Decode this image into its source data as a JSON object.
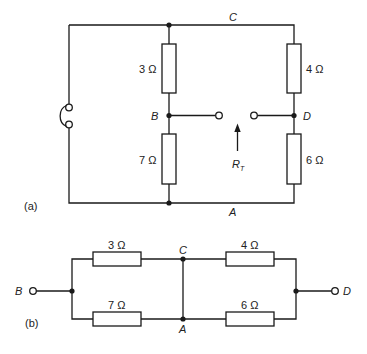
{
  "diagram_a": {
    "caption": "(a)",
    "nodes": {
      "C": "C",
      "B": "B",
      "D": "D",
      "A": "A"
    },
    "resistors": {
      "top_left": "3 Ω",
      "bottom_left": "7 Ω",
      "top_right": "4 Ω",
      "bottom_right": "6 Ω"
    },
    "rt_label": {
      "main": "R",
      "subscript": "T"
    }
  },
  "diagram_b": {
    "caption": "(b)",
    "nodes": {
      "B": "B",
      "C": "C",
      "A": "A",
      "D": "D"
    },
    "resistors": {
      "top_left": "3 Ω",
      "bottom_left": "7 Ω",
      "top_right": "4 Ω",
      "bottom_right": "6 Ω"
    }
  }
}
